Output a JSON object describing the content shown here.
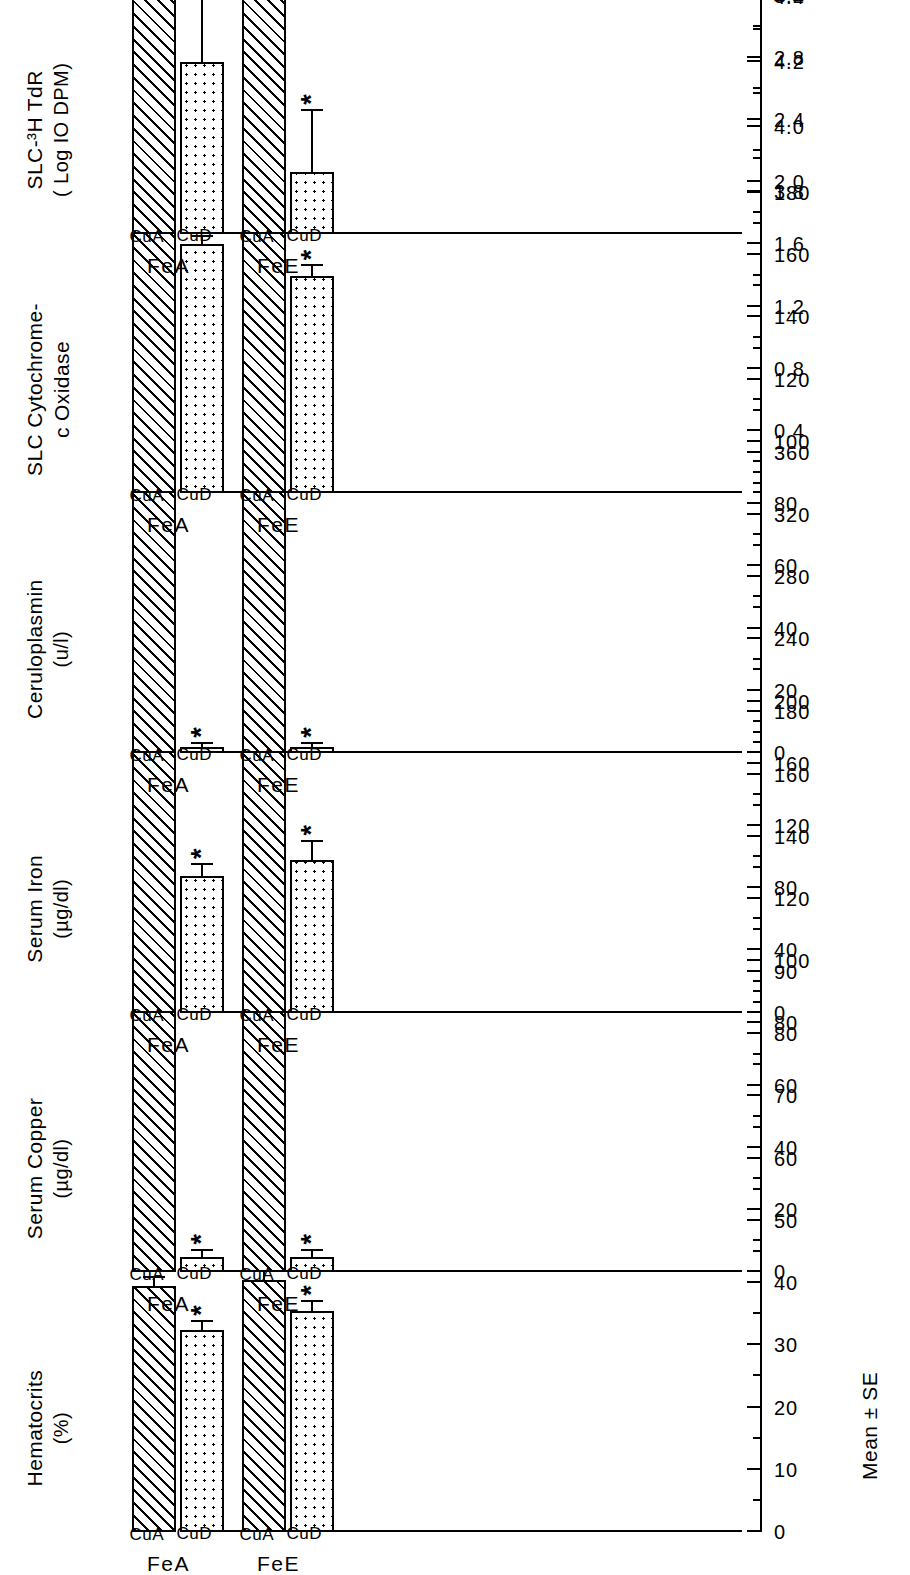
{
  "figure": {
    "axis_caption": "Mean ± SE",
    "group_labels": [
      "FeA",
      "FeE"
    ],
    "sub_labels": [
      "CuA",
      "CuD",
      "CuA",
      "CuD"
    ],
    "significance_marker": "*",
    "hatch_legend": "CuA (diagonal hatch)",
    "dots_legend": "CuD (stippled)"
  },
  "chart_data": [
    {
      "type": "bar",
      "panel": 1,
      "title": "Hematocrits",
      "subtitle": "(%)",
      "ylabel": "Mean ± SE",
      "xlabel": "",
      "ylim": [
        0,
        90
      ],
      "ticks": [
        0,
        10,
        20,
        30,
        40,
        50,
        60,
        70,
        80,
        90
      ],
      "tick_labels": [
        "0",
        "10",
        "20",
        "30",
        "40",
        "50",
        "60",
        "70",
        "80",
        "90"
      ],
      "minor_tick_step": 5,
      "grid": false,
      "categories": [
        "FeA CuA",
        "FeA CuD",
        "FeE CuA",
        "FeE CuD"
      ],
      "fills": [
        "hatch",
        "dots",
        "hatch",
        "dots"
      ],
      "values": [
        39.5,
        32.5,
        40.5,
        35.5
      ],
      "errors": [
        1.3,
        1.3,
        1.3,
        1.5
      ],
      "significant": [
        false,
        true,
        false,
        true
      ]
    },
    {
      "type": "bar",
      "panel": 2,
      "title": "Serum Copper",
      "subtitle": "(µg/dl)",
      "ylabel": "Mean ± SE",
      "xlabel": "",
      "ylim": [
        0,
        180
      ],
      "ticks": [
        0,
        20,
        40,
        60,
        80,
        100,
        120,
        140,
        160,
        180
      ],
      "tick_labels": [
        "0",
        "20",
        "40",
        "60",
        "80",
        "100",
        "120",
        "140",
        "160",
        "180"
      ],
      "minor_tick_step": 10,
      "grid": false,
      "categories": [
        "FeA CuA",
        "FeA CuD",
        "FeE CuA",
        "FeE CuD"
      ],
      "fills": [
        "hatch",
        "dots",
        "hatch",
        "dots"
      ],
      "values": [
        107,
        5,
        103,
        5
      ],
      "errors": [
        9,
        2,
        14,
        2
      ],
      "significant": [
        false,
        true,
        false,
        true
      ]
    },
    {
      "type": "bar",
      "panel": 3,
      "title": "Serum Iron",
      "subtitle": "(µg/dl)",
      "ylabel": "Mean ± SE",
      "xlabel": "",
      "ylim": [
        0,
        360
      ],
      "ticks": [
        0,
        40,
        80,
        120,
        160,
        200,
        240,
        280,
        320,
        360
      ],
      "tick_labels": [
        "0",
        "40",
        "80",
        "120",
        "160",
        "200",
        "240",
        "280",
        "320",
        "360"
      ],
      "minor_tick_step": 20,
      "grid": false,
      "categories": [
        "FeA CuA",
        "FeA CuD",
        "FeE CuA",
        "FeE CuD"
      ],
      "fills": [
        "hatch",
        "dots",
        "hatch",
        "dots"
      ],
      "values": [
        235,
        88,
        287,
        98
      ],
      "errors": [
        15,
        7,
        14,
        12
      ],
      "significant": [
        false,
        true,
        false,
        true
      ]
    },
    {
      "type": "bar",
      "panel": 4,
      "title": "Ceruloplasmin",
      "subtitle": "(u/l)",
      "ylabel": "Mean ± SE",
      "xlabel": "",
      "ylim": [
        0,
        180
      ],
      "ticks": [
        0,
        20,
        40,
        60,
        80,
        100,
        120,
        140,
        160,
        180
      ],
      "tick_labels": [
        "0",
        "20",
        "40",
        "60",
        "80",
        "100",
        "120",
        "140",
        "160",
        "180"
      ],
      "minor_tick_step": 10,
      "grid": false,
      "categories": [
        "FeA CuA",
        "FeA CuD",
        "FeE CuA",
        "FeE CuD"
      ],
      "fills": [
        "hatch",
        "dots",
        "hatch",
        "dots"
      ],
      "values": [
        150,
        2,
        117,
        2
      ],
      "errors": [
        9,
        1,
        20,
        1
      ],
      "significant": [
        false,
        true,
        false,
        true
      ]
    },
    {
      "type": "bar",
      "panel": 5,
      "title": "SLC Cytochrome-\nc Oxidase",
      "subtitle": "",
      "ylabel": "Mean ± SE",
      "xlabel": "",
      "ylim": [
        0,
        3.6
      ],
      "ticks": [
        0.4,
        0.8,
        1.2,
        1.6,
        2.0,
        2.4,
        2.8,
        3.2,
        3.6
      ],
      "tick_labels": [
        "0.4",
        "0.8",
        "1.2",
        "1.6",
        "2.0",
        "2.4",
        "2.8",
        "3.2",
        "3.6"
      ],
      "minor_tick_step": 0.2,
      "grid": false,
      "categories": [
        "FeA CuA",
        "FeA CuD",
        "FeE CuA",
        "FeE CuD"
      ],
      "fills": [
        "hatch",
        "dots",
        "hatch",
        "dots"
      ],
      "values": [
        3.4,
        1.6,
        3.5,
        1.4
      ],
      "errors": [
        0.07,
        0.05,
        0.06,
        0.06
      ],
      "significant": [
        false,
        true,
        false,
        true
      ]
    },
    {
      "type": "bar",
      "panel": 6,
      "title": "SLC-³H TdR",
      "subtitle": "( Log IO DPM)",
      "ylabel": "Mean ± SE",
      "xlabel": "",
      "ylim": [
        3.67,
        5.4
      ],
      "ticks": [
        3.8,
        4.0,
        4.2,
        4.4,
        4.6,
        4.8,
        5.0,
        5.2,
        5.4
      ],
      "tick_labels": [
        "3.8",
        "4.0",
        "4.2",
        "4.4",
        "4.6",
        "4.8",
        "5.0",
        "5.2",
        "5.4"
      ],
      "minor_tick_step": 0.1,
      "grid": false,
      "categories": [
        "FeA CuA",
        "FeA CuD",
        "FeE CuA",
        "FeE CuD"
      ],
      "fills": [
        "hatch",
        "dots",
        "hatch",
        "dots"
      ],
      "values": [
        5.2,
        4.2,
        4.72,
        3.86
      ],
      "errors": [
        0.06,
        0.2,
        0.13,
        0.19
      ],
      "significant": [
        false,
        true,
        false,
        true
      ]
    }
  ]
}
